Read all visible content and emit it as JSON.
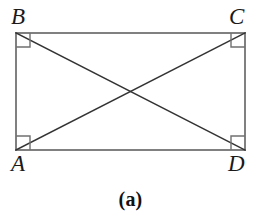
{
  "figure": {
    "caption": "(a)",
    "background_color": "#ffffff",
    "width": 261,
    "height": 224,
    "shape": {
      "type": "rectangle",
      "stroke_color": "#808080",
      "stroke_width": 2,
      "left": 16,
      "top": 33,
      "right": 245,
      "bottom": 150,
      "width": 229,
      "height": 117
    },
    "diagonals": {
      "stroke_color": "#333333",
      "stroke_width": 1.5,
      "intersection": {
        "x": 131,
        "y": 92
      },
      "segments": [
        {
          "name": "diagonal-A-C",
          "from": "A",
          "to": "C",
          "x1": 16,
          "y1": 150,
          "x2": 245,
          "y2": 33
        },
        {
          "name": "diagonal-B-D",
          "from": "B",
          "to": "D",
          "x1": 16,
          "y1": 33,
          "x2": 245,
          "y2": 150
        }
      ]
    },
    "right_angle_markers": {
      "stroke_color": "#707070",
      "stroke_width": 1.4,
      "size": 14,
      "count": 4,
      "at_vertices": [
        "B",
        "C",
        "A",
        "D"
      ]
    },
    "vertices": [
      {
        "id": "B",
        "label": "B",
        "corner": "top-left",
        "x": 16,
        "y": 33
      },
      {
        "id": "C",
        "label": "C",
        "corner": "top-right",
        "x": 245,
        "y": 33
      },
      {
        "id": "A",
        "label": "A",
        "corner": "bottom-left",
        "x": 16,
        "y": 150
      },
      {
        "id": "D",
        "label": "D",
        "corner": "bottom-right",
        "x": 245,
        "y": 150
      }
    ]
  }
}
